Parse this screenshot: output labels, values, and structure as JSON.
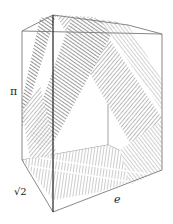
{
  "diagram": {
    "type": "3d-box-billiard-trajectory",
    "labels": {
      "height": "π",
      "depth": "√2",
      "width": "e"
    },
    "colors": {
      "background": "#ffffff",
      "edge": "#7a7a7a",
      "front_edge": "#222222",
      "trajectory_dark": "#6e6e6e",
      "trajectory_light": "#a8a8a8"
    },
    "box_vertices": {
      "top_left_front": [
        22,
        31
      ],
      "top_back_left": [
        53,
        15
      ],
      "top_back_right": [
        128,
        25
      ],
      "top_right_front": [
        162,
        34
      ],
      "bottom_left_front": [
        22,
        160
      ],
      "bottom_front": [
        53,
        212
      ],
      "bottom_right_front": [
        162,
        170
      ],
      "inner_back_bottom": [
        108,
        145
      ]
    }
  }
}
